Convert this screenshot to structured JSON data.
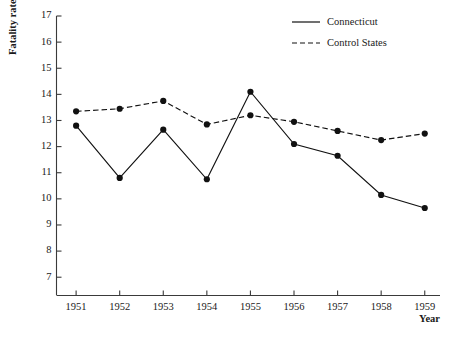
{
  "chart_data": {
    "type": "line",
    "title": "",
    "xlabel": "Year",
    "ylabel": "Fatality rate",
    "x": [
      1951,
      1952,
      1953,
      1954,
      1955,
      1956,
      1957,
      1958,
      1959
    ],
    "xticklabels": [
      "1951",
      "1952",
      "1953",
      "1954",
      "1955",
      "1956",
      "1957",
      "1958",
      "1959"
    ],
    "yticklabels": [
      "7",
      "8",
      "9",
      "10",
      "11",
      "12",
      "13",
      "14",
      "15",
      "16",
      "17"
    ],
    "ylim": [
      6.3,
      17
    ],
    "xlim": [
      1950.55,
      1959.35
    ],
    "grid": false,
    "legend_position": "top-right",
    "series": [
      {
        "name": "Connecticut",
        "style": "solid",
        "marker": "filled-circle",
        "color": "#111111",
        "values": [
          12.8,
          10.8,
          12.65,
          10.75,
          14.1,
          12.1,
          11.65,
          10.15,
          9.65
        ]
      },
      {
        "name": "Control States",
        "style": "dashed",
        "marker": "filled-circle",
        "color": "#111111",
        "values": [
          13.35,
          13.45,
          13.75,
          12.85,
          13.2,
          12.95,
          12.6,
          12.25,
          12.5
        ]
      }
    ]
  },
  "legend": {
    "entries": [
      {
        "label": "Connecticut"
      },
      {
        "label": "Control States"
      }
    ]
  },
  "axes": {
    "y_title": "Fatality rate",
    "x_title": "Year"
  }
}
